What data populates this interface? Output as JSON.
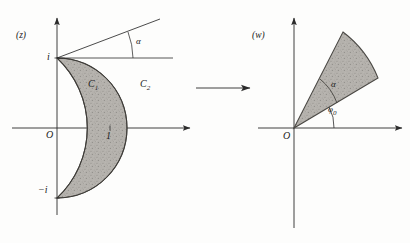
{
  "figure": {
    "caption": "",
    "background": "#fdfdfc",
    "ink": "#2b2b2b",
    "shade_fill": "#b3b0ab",
    "shade_stroke": "#4a4844"
  },
  "z_plane": {
    "plane_label": "(z)",
    "origin_label": "O",
    "axis_labels": {
      "x_unit": "1",
      "y_top": "i",
      "y_bottom": "−i"
    },
    "curve_labels": {
      "inner": "C",
      "inner_sub": "1",
      "outer": "C",
      "outer_sub": "2"
    },
    "angle_label": "α",
    "region_description": "lune bounded by arcs C1 and C2 meeting at i and −i"
  },
  "mapping_arrow": {
    "name": "maps-to",
    "direction": "right"
  },
  "w_plane": {
    "plane_label": "(w)",
    "origin_label": "O",
    "angle_label": "α",
    "base_angle_label": "φ",
    "base_angle_sub": "0",
    "region_description": "circular sector of opening angle alpha inclined at phi-zero"
  }
}
